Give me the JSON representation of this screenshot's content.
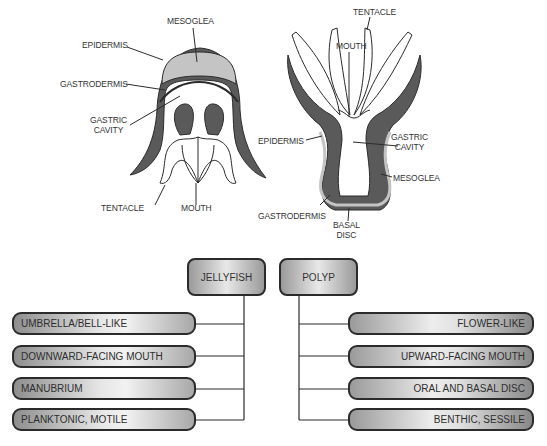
{
  "jellyfish_diagram": {
    "labels": {
      "mesoglea": "MESOGLEA",
      "epidermis": "EPIDERMIS",
      "gastrodermis": "GASTRODERMIS",
      "gastric_cavity_1": "GASTRIC",
      "gastric_cavity_2": "CAVITY",
      "tentacle": "TENTACLE",
      "mouth": "MOUTH"
    }
  },
  "polyp_diagram": {
    "labels": {
      "tentacle": "TENTACLE",
      "mouth": "MOUTH",
      "epidermis": "EPIDERMIS",
      "gastric_cavity_1": "GASTRIC",
      "gastric_cavity_2": "CAVITY",
      "mesoglea": "MESOGLEA",
      "gastrodermis": "GASTRODERMIS",
      "basal_disc_1": "BASAL",
      "basal_disc_2": "DISC"
    }
  },
  "comparison": {
    "jellyfish": {
      "title": "JELLYFISH",
      "traits": [
        "UMBRELLA/BELL-LIKE",
        "DOWNWARD-FACING MOUTH",
        "MANUBRIUM",
        "PLANKTONIC, MOTILE"
      ]
    },
    "polyp": {
      "title": "POLYP",
      "traits": [
        "FLOWER-LIKE",
        "UPWARD-FACING MOUTH",
        "ORAL AND BASAL DISC",
        "BENTHIC, SESSILE"
      ]
    }
  },
  "colors": {
    "epidermis": "#5a5a5a",
    "mesoglea": "#c4c4c4",
    "outline": "#2b2b2b"
  }
}
